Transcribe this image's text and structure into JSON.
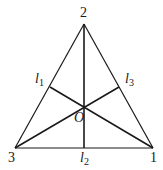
{
  "diagram": {
    "type": "equilateral-triangle-with-cevians",
    "stroke_color": "#1a1a1a",
    "vertices": [
      {
        "id": "2",
        "label": "2",
        "x": 84,
        "y": 24
      },
      {
        "id": "3",
        "label": "3",
        "x": 15,
        "y": 148
      },
      {
        "id": "1",
        "label": "1",
        "x": 153,
        "y": 148
      }
    ],
    "center": {
      "label": "O",
      "x": 84,
      "y": 107
    },
    "feet": [
      {
        "id": "l1",
        "base": "l",
        "sub": "1",
        "x": 50,
        "y": 87
      },
      {
        "id": "l2",
        "base": "l",
        "sub": "2",
        "x": 84,
        "y": 148
      },
      {
        "id": "l3",
        "base": "l",
        "sub": "3",
        "x": 119,
        "y": 87
      }
    ],
    "labels": {
      "v2": "2",
      "v3": "3",
      "v1": "1",
      "center": "O",
      "l1_base": "l",
      "l1_sub": "1",
      "l2_base": "l",
      "l2_sub": "2",
      "l3_base": "l",
      "l3_sub": "3"
    }
  }
}
